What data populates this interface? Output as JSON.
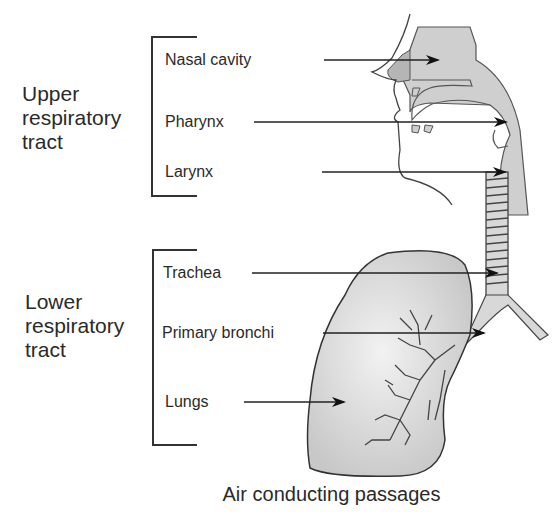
{
  "title": "Air conducting passages",
  "groups": [
    {
      "name": "upper",
      "label_lines": [
        "Upper",
        "respiratory",
        "tract"
      ],
      "parts": [
        "Nasal cavity",
        "Pharynx",
        "Larynx"
      ]
    },
    {
      "name": "lower",
      "label_lines": [
        "Lower",
        "respiratory",
        "tract"
      ],
      "parts": [
        "Trachea",
        "Primary bronchi",
        "Lungs"
      ]
    }
  ],
  "colors": {
    "fill": "#cfcfcf",
    "outline": "#333333",
    "arrow": "#111111",
    "text": "#2a2a2a"
  }
}
